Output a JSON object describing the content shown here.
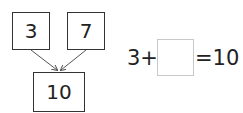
{
  "diagram": {
    "top_left_value": "3",
    "top_right_value": "7",
    "bottom_value": "10",
    "arrow_color": "#555555",
    "box_border_color": "#333333"
  },
  "equation": {
    "left": "3+",
    "blank": "",
    "right": "=10",
    "blank_border_color": "#c8c8c8"
  }
}
